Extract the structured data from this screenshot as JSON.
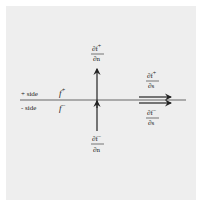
{
  "diagram": {
    "labels": {
      "plus_side": "+ side",
      "minus_side": "- side",
      "f_plus": "f",
      "f_plus_sup": "+",
      "f_minus": "f",
      "f_minus_sup": "−"
    },
    "derivatives": {
      "normal_plus": {
        "numerator": "∂f",
        "sup": "+",
        "denominator": "∂n"
      },
      "normal_minus": {
        "numerator": "∂f",
        "sup": "−",
        "denominator": "∂n"
      },
      "tangent_plus": {
        "numerator": "∂f",
        "sup": "+",
        "denominator": "∂s"
      },
      "tangent_minus": {
        "numerator": "∂f",
        "sup": "−",
        "denominator": "∂s"
      }
    },
    "colors": {
      "background": "#eeeeee",
      "stroke": "#222222",
      "line": "#555555"
    }
  }
}
